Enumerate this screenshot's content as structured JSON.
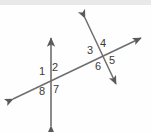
{
  "figure": {
    "background_color": "#fefefe",
    "line_color": "#6e6e6e",
    "label_color": "#3a3a3a",
    "width": 151,
    "height": 132
  },
  "lines": [
    {
      "name": "vertical-line",
      "description": "vertical line with arrowheads at both ends",
      "x1": 51,
      "y1": 126,
      "x2": 51,
      "y2": 38,
      "arrow_start": true,
      "arrow_end": true
    },
    {
      "name": "transversal-line",
      "description": "long rising line crossing both other lines, arrowheads at both ends",
      "x1": 13,
      "y1": 99,
      "x2": 141,
      "y2": 38,
      "arrow_start": true,
      "arrow_end": true
    },
    {
      "name": "second-slanted-line",
      "description": "steep descending line on the right, arrowheads at both ends",
      "x1": 85,
      "y1": 18,
      "x2": 116,
      "y2": 84,
      "arrow_start": true,
      "arrow_end": true
    }
  ],
  "intersections": [
    {
      "name": "left-intersection",
      "x": 51,
      "y": 79
    },
    {
      "name": "right-intersection",
      "x": 102,
      "y": 55
    }
  ],
  "angle_labels": [
    {
      "id": "angle-1",
      "text": "1",
      "x": 39,
      "y": 66,
      "intersection": "left-intersection",
      "position": "upper-left"
    },
    {
      "id": "angle-2",
      "text": "2",
      "x": 52,
      "y": 62,
      "intersection": "left-intersection",
      "position": "upper-right"
    },
    {
      "id": "angle-8",
      "text": "8",
      "x": 39,
      "y": 86,
      "intersection": "left-intersection",
      "position": "lower-left"
    },
    {
      "id": "angle-7",
      "text": "7",
      "x": 53,
      "y": 84,
      "intersection": "left-intersection",
      "position": "lower-right"
    },
    {
      "id": "angle-3",
      "text": "3",
      "x": 87,
      "y": 45,
      "intersection": "right-intersection",
      "position": "upper-left"
    },
    {
      "id": "angle-4",
      "text": "4",
      "x": 100,
      "y": 38,
      "intersection": "right-intersection",
      "position": "upper-right"
    },
    {
      "id": "angle-6",
      "text": "6",
      "x": 95,
      "y": 61,
      "intersection": "right-intersection",
      "position": "lower-left"
    },
    {
      "id": "angle-5",
      "text": "5",
      "x": 109,
      "y": 55,
      "intersection": "right-intersection",
      "position": "lower-right"
    }
  ]
}
